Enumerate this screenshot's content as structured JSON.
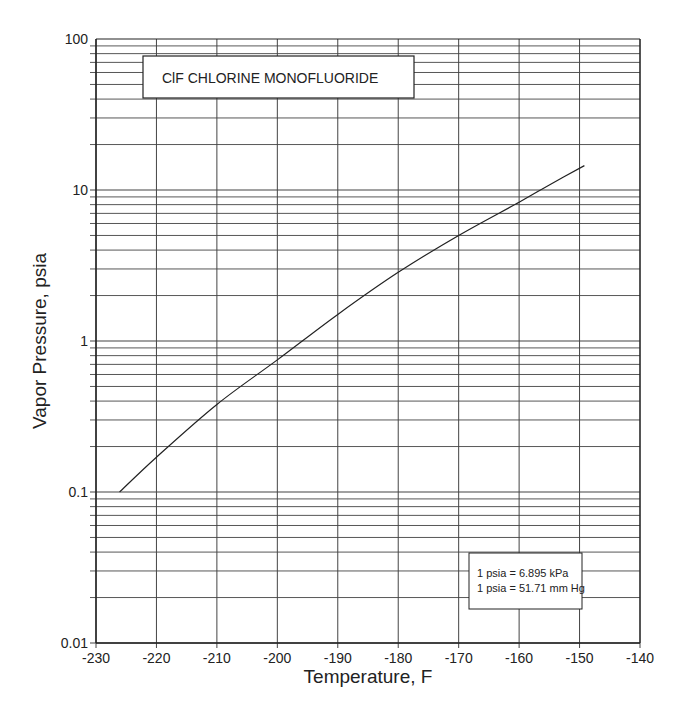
{
  "chart_data": {
    "type": "line",
    "title": "ClF  CHLORINE  MONOFLUORIDE",
    "xlabel": "Temperature, F",
    "ylabel": "Vapor Pressure, psia",
    "xlim": [
      -230,
      -140
    ],
    "ylim": [
      0.01,
      100
    ],
    "yscale": "log",
    "grid": true,
    "x_ticks": [
      -230,
      -220,
      -210,
      -200,
      -190,
      -180,
      -170,
      -160,
      -150,
      -140
    ],
    "x_tick_labels": [
      "-230",
      "-220",
      "-210",
      "-200",
      "-190",
      "-180",
      "-170",
      "-160",
      "-150",
      "-140"
    ],
    "y_ticks": [
      0.01,
      0.1,
      1,
      10,
      100
    ],
    "y_tick_labels": [
      "0.01",
      "0.1",
      "1",
      "10",
      "100"
    ],
    "series": [
      {
        "name": "ClF vapor pressure",
        "x": [
          -226.1,
          -220,
          -210,
          -200,
          -190,
          -180,
          -170,
          -160,
          -155,
          -149.2
        ],
        "y": [
          0.1,
          0.17,
          0.38,
          0.75,
          1.5,
          2.85,
          5.0,
          8.3,
          10.8,
          14.5
        ]
      }
    ],
    "annotations": [
      {
        "text": "1 psia = 6.895 kPa"
      },
      {
        "text": "1 psia = 51.71 mm Hg"
      }
    ]
  },
  "labels": {
    "title": "ClF   CHLORINE  MONOFLUORIDE",
    "xlabel": "Temperature, F",
    "ylabel": "Vapor Pressure, psia",
    "conversion_1": "1 psia = 6.895 kPa",
    "conversion_2": "1 psia = 51.71 mm Hg"
  },
  "colors": {
    "line": "#222222",
    "grid": "#555555",
    "background": "#ffffff"
  }
}
